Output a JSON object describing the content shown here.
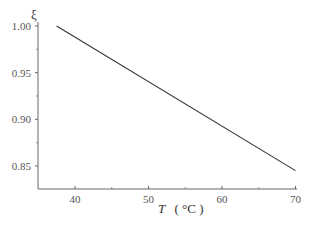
{
  "chart_data": {
    "type": "line",
    "title": "",
    "xlabel": "T (°C)",
    "xlabel_parts": {
      "var": "T",
      "unit": "( °C )"
    },
    "ylabel": "ξ",
    "xlim": [
      35,
      70
    ],
    "ylim": [
      0.825,
      1.0
    ],
    "x_ticks": [
      40,
      50,
      60,
      70
    ],
    "x_tick_labels": [
      "40",
      "50",
      "60",
      "70"
    ],
    "y_ticks": [
      0.85,
      0.9,
      0.95,
      1.0
    ],
    "y_tick_labels": [
      "0.85",
      "0.90",
      "0.95",
      "1.00"
    ],
    "grid": false,
    "legend": null,
    "series": [
      {
        "name": "ξ(T)",
        "x": [
          37.5,
          70
        ],
        "y": [
          1.0,
          0.845
        ]
      }
    ]
  }
}
